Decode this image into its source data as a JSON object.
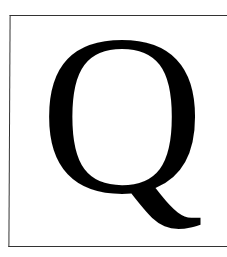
{
  "letter": {
    "character": "Q",
    "color": "#000000"
  },
  "frame": {
    "border_color": "#333333",
    "background": "#ffffff"
  }
}
